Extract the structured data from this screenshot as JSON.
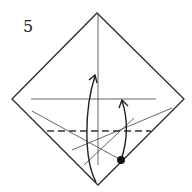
{
  "diagram": {
    "step_number": "5",
    "colors": {
      "outline": "#2a2a2a",
      "crease": "#555555",
      "arrow": "#222222",
      "dot": "#111111",
      "background": "#ffffff"
    },
    "paper_outline": {
      "shape": "diamond",
      "vertices": [
        [
          97,
          13
        ],
        [
          184,
          99
        ],
        [
          98,
          185
        ],
        [
          12,
          99
        ]
      ]
    },
    "crease_lines": [
      {
        "name": "horizontal-crease",
        "from": [
          31,
          99
        ],
        "to": [
          156,
          99
        ]
      },
      {
        "name": "vertical-crease",
        "from": [
          98,
          13
        ],
        "to": [
          98,
          165
        ]
      },
      {
        "name": "diagonal-crease-left",
        "from": [
          32,
          111
        ],
        "to": [
          121,
          160
        ]
      },
      {
        "name": "diagonal-crease-right-long",
        "from": [
          172,
          108
        ],
        "to": [
          72,
          150
        ]
      },
      {
        "name": "diagonal-crease-right-short",
        "from": [
          134,
          118
        ],
        "to": [
          84,
          165
        ]
      }
    ],
    "valley_fold_line": {
      "style": "dashed",
      "from": [
        47,
        131
      ],
      "to": [
        151,
        131
      ]
    },
    "arrows": [
      {
        "name": "large-fold-arrow",
        "from": [
          95,
          182
        ],
        "to": [
          95,
          75
        ],
        "direction": "up"
      },
      {
        "name": "small-fold-arrow",
        "from": [
          121,
          160
        ],
        "to": [
          122,
          100
        ],
        "direction": "up"
      }
    ],
    "reference_dot": {
      "cx": 121,
      "cy": 160,
      "r": 4
    }
  }
}
